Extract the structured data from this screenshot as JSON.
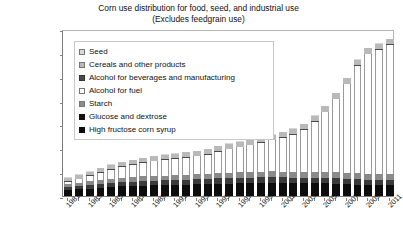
{
  "chart_data": {
    "type": "bar",
    "stacked": true,
    "title": "Corn use distribution for food, seed, and industrial use",
    "subtitle": "(Excludes feedgrain use)",
    "xlabel": "",
    "ylabel": "Million bushels",
    "ylim": [
      0,
      7000
    ],
    "ytick_labels": [
      "0",
      "1000",
      "2000",
      "3000",
      "4000",
      "5000",
      "6000",
      "7000"
    ],
    "ytick_values": [
      0,
      1000,
      2000,
      3000,
      4000,
      5000,
      6000,
      7000
    ],
    "grid": false,
    "legend_position": "upper-left-inside",
    "x": [
      1981,
      1982,
      1983,
      1984,
      1985,
      1986,
      1987,
      1988,
      1989,
      1990,
      1991,
      1992,
      1993,
      1994,
      1995,
      1996,
      1997,
      1998,
      1999,
      2000,
      2001,
      2002,
      2003,
      2004,
      2005,
      2006,
      2007,
      2008,
      2009,
      2010,
      2011
    ],
    "xtick_labels": [
      "1981",
      "1983",
      "1985",
      "1987",
      "1989",
      "1991",
      "1993",
      "1995",
      "1997",
      "1999",
      "2001",
      "2003",
      "2005",
      "2007",
      "2009",
      "2011"
    ],
    "series": [
      {
        "name": "High fructose corn syrup",
        "color": "#0d0d0d",
        "values": [
          250,
          280,
          310,
          350,
          380,
          400,
          420,
          440,
          450,
          460,
          470,
          480,
          490,
          500,
          510,
          515,
          525,
          535,
          545,
          550,
          545,
          540,
          535,
          530,
          525,
          515,
          500,
          480,
          470,
          465,
          460
        ]
      },
      {
        "name": "Glucose and dextrose",
        "color": "#3b3b3b",
        "values": [
          130,
          140,
          150,
          160,
          170,
          180,
          185,
          190,
          195,
          200,
          205,
          210,
          215,
          220,
          225,
          228,
          230,
          232,
          235,
          238,
          235,
          233,
          230,
          228,
          226,
          224,
          222,
          218,
          215,
          213,
          212
        ]
      },
      {
        "name": "Starch",
        "color": "#8a8a8a",
        "values": [
          130,
          140,
          150,
          160,
          170,
          180,
          185,
          190,
          195,
          200,
          205,
          210,
          215,
          220,
          225,
          228,
          232,
          236,
          240,
          245,
          248,
          250,
          252,
          254,
          256,
          258,
          260,
          255,
          250,
          248,
          245
        ]
      },
      {
        "name": "Alcohol for fuel",
        "color": "#ffffff",
        "values": [
          80,
          140,
          220,
          310,
          390,
          460,
          510,
          560,
          610,
          640,
          670,
          700,
          740,
          800,
          900,
          980,
          1050,
          1120,
          1200,
          1300,
          1400,
          1550,
          1750,
          2100,
          2500,
          3050,
          3700,
          4500,
          5000,
          5200,
          5400
        ]
      },
      {
        "name": "Alcohol for beverages and manufacturing",
        "color": "#4a4a4a",
        "values": [
          35,
          35,
          35,
          35,
          35,
          35,
          35,
          35,
          35,
          35,
          35,
          35,
          35,
          35,
          35,
          35,
          35,
          35,
          35,
          35,
          35,
          35,
          35,
          35,
          35,
          35,
          35,
          35,
          35,
          35,
          35
        ]
      },
      {
        "name": "Cereals and other products",
        "color": "#b9b9b9",
        "values": [
          145,
          150,
          155,
          160,
          165,
          170,
          175,
          180,
          185,
          188,
          190,
          192,
          194,
          196,
          198,
          200,
          202,
          204,
          206,
          208,
          210,
          212,
          214,
          216,
          218,
          220,
          222,
          224,
          226,
          228,
          230
        ]
      },
      {
        "name": "Seed",
        "color": "#d8d8d8",
        "values": [
          20,
          20,
          20,
          20,
          20,
          20,
          20,
          20,
          20,
          20,
          20,
          20,
          20,
          20,
          20,
          20,
          20,
          20,
          20,
          20,
          20,
          20,
          20,
          20,
          20,
          20,
          20,
          20,
          20,
          20,
          20
        ]
      }
    ]
  },
  "legend": {
    "items": [
      {
        "label": "Seed",
        "swatch": "sw-seed"
      },
      {
        "label": "Cereals and other products",
        "swatch": "sw-cereals"
      },
      {
        "label": "Alcohol for beverages and manufacturing",
        "swatch": "sw-albev"
      },
      {
        "label": "Alcohol for fuel",
        "swatch": "sw-alfuel"
      },
      {
        "label": "Starch",
        "swatch": "sw-starch"
      },
      {
        "label": "Glucose and dextrose",
        "swatch": "sw-glucose"
      },
      {
        "label": "High fructose corn syrup",
        "swatch": "sw-hfcs"
      }
    ]
  }
}
